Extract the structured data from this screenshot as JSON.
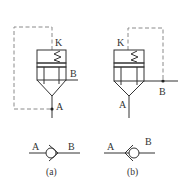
{
  "diagram": {
    "type": "hydraulic-check-valve-symbols",
    "colors": {
      "line": "#333333",
      "dashed": "#8a8a8a",
      "background": "#ffffff"
    },
    "valve_a": {
      "caption": "(a)",
      "port_k": "K",
      "port_a": "A",
      "port_b": "B",
      "pilot_connection": "A"
    },
    "valve_b": {
      "caption": "(b)",
      "port_k": "K",
      "port_a": "A",
      "port_b": "B",
      "pilot_connection": "B"
    },
    "simplified_a": {
      "port_a": "A",
      "port_b": "B"
    },
    "simplified_b": {
      "port_a": "A",
      "port_b": "B"
    }
  }
}
